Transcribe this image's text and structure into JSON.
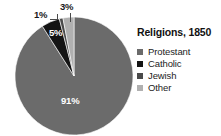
{
  "chart_data": {
    "type": "pie",
    "title": "Religions, 1850",
    "xlabel": "",
    "ylabel": "",
    "legend_position": "right",
    "grid": false,
    "categories": [
      "Protestant",
      "Catholic",
      "Jewish",
      "Other"
    ],
    "values": [
      91,
      5,
      1,
      3
    ],
    "value_labels": [
      "91%",
      "5%",
      "1%",
      "3%"
    ],
    "value_unit": "%",
    "colors": [
      "#6b6b6b",
      "#141414",
      "#4a4a4a",
      "#b0b0b0"
    ],
    "slices": [
      {
        "label": "Protestant",
        "value": 91,
        "value_label": "91%",
        "color": "#6b6b6b",
        "label_placement": "inside"
      },
      {
        "label": "Catholic",
        "value": 5,
        "value_label": "5%",
        "color": "#141414",
        "label_placement": "inside"
      },
      {
        "label": "Jewish",
        "value": 1,
        "value_label": "1%",
        "color": "#4a4a4a",
        "label_placement": "outside"
      },
      {
        "label": "Other",
        "value": 3,
        "value_label": "3%",
        "color": "#b0b0b0",
        "label_placement": "outside"
      }
    ]
  },
  "legend": {
    "title": "Religions, 1850",
    "items": [
      {
        "label": "Protestant",
        "color": "#6b6b6b"
      },
      {
        "label": "Catholic",
        "color": "#141414"
      },
      {
        "label": "Jewish",
        "color": "#4a4a4a"
      },
      {
        "label": "Other",
        "color": "#b0b0b0"
      }
    ]
  }
}
